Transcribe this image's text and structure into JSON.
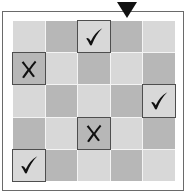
{
  "board": {
    "rows": 5,
    "cols": 5,
    "selected_column": 3,
    "colors": {
      "light": "#d8d8d8",
      "dark": "#b7b7b7",
      "mark_border": "#4e4e4e",
      "glyph": "#111111",
      "marker": "#111111"
    },
    "cells": [
      [
        "",
        "",
        "check",
        "",
        ""
      ],
      [
        "cross",
        "",
        "",
        "",
        ""
      ],
      [
        "",
        "",
        "",
        "",
        "check"
      ],
      [
        "",
        "",
        "cross",
        "",
        ""
      ],
      [
        "check",
        "",
        "",
        "",
        ""
      ]
    ]
  },
  "icons": {
    "marker": "down-triangle-icon",
    "check": "check-icon",
    "cross": "cross-icon"
  }
}
